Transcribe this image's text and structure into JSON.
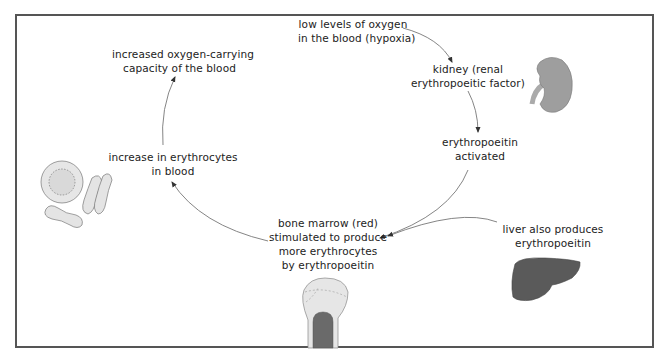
{
  "diagram": {
    "nodes": {
      "hypoxia": {
        "line1": "low levels of oxygen",
        "line2": "in the blood (hypoxia)"
      },
      "kidney": {
        "line1": "kidney (renal",
        "line2": "erythropoeitic factor)"
      },
      "epo_activated": {
        "line1": "erythropoeitin",
        "line2": "activated"
      },
      "bone_marrow": {
        "line1": "bone marrow (red)",
        "line2": "stimulated to produce",
        "line3": "more erythrocytes",
        "line4": "by erythropoeitin"
      },
      "liver": {
        "line1": "liver also produces",
        "line2": "erythropoeitin"
      },
      "increase_erythrocytes": {
        "line1": "increase in erythrocytes",
        "line2": "in blood"
      },
      "oxygen_capacity": {
        "line1": "increased oxygen-carrying",
        "line2": "capacity of the blood"
      }
    },
    "illustrations": [
      "kidney-illustration",
      "liver-illustration",
      "bone-illustration",
      "erythrocytes-illustration"
    ],
    "colors": {
      "border": "#555555",
      "arrow": "#666666",
      "organ_fill": "#9a9a9a",
      "liver_fill": "#5a5a5a",
      "bone_fill": "#e6e6e6",
      "marrow_fill": "#6a6a6a",
      "cell_fill": "#e4e4e4"
    }
  }
}
